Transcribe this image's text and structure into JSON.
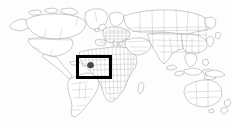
{
  "figure": {
    "type": "locator-map",
    "background_color": "#fdfdfd",
    "outline_color": "#8f8f8f",
    "border_color": "#a2a2a2",
    "highlight_box_color": "#000000",
    "highlight_fill_color": "#4a4a4a",
    "width_px": 232,
    "height_px": 128
  },
  "highlight_box": {
    "label": "highlight rectangle",
    "x_px": 76,
    "y_px": 55,
    "width_px": 36,
    "height_px": 24,
    "stroke_px": 3
  },
  "highlight_region": {
    "label": "highlighted country",
    "x_px": 90,
    "y_px": 64
  },
  "continents": [
    {
      "name": "North America"
    },
    {
      "name": "South America"
    },
    {
      "name": "Europe"
    },
    {
      "name": "Africa"
    },
    {
      "name": "Asia"
    },
    {
      "name": "Australia"
    }
  ]
}
